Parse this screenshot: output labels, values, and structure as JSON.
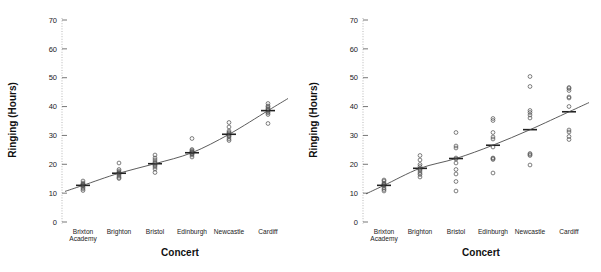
{
  "figure": {
    "title": "",
    "panel_count": 2
  },
  "chart_data": [
    {
      "type": "scatter",
      "title": "",
      "panel": "left",
      "xlabel": "Concert",
      "ylabel": "Ringing (Hours)",
      "categories": [
        "Brixton Academy",
        "Brighton",
        "Bristol",
        "Edinburgh",
        "Newcastle",
        "Cardiff"
      ],
      "yticks": [
        0,
        10,
        20,
        30,
        40,
        50,
        60,
        70
      ],
      "ylim": [
        0,
        73
      ],
      "grid": false,
      "legend": null,
      "annotations": [
        "fitted trend line through group means"
      ],
      "series": [
        {
          "name": "Brixton Academy",
          "values": [
            11.0,
            11.5,
            12.0,
            12.4,
            12.6,
            12.8,
            13.0,
            13.2,
            13.6,
            14.2
          ]
        },
        {
          "name": "Brighton",
          "values": [
            15.0,
            15.4,
            16.0,
            16.4,
            16.8,
            17.0,
            17.2,
            17.6,
            18.2,
            20.4
          ]
        },
        {
          "name": "Bristol",
          "values": [
            17.2,
            18.4,
            19.0,
            19.6,
            20.0,
            20.4,
            20.8,
            21.4,
            22.2,
            23.2
          ]
        },
        {
          "name": "Edinburgh",
          "values": [
            22.6,
            23.2,
            23.6,
            23.8,
            24.0,
            24.2,
            24.4,
            24.8,
            25.2,
            29.0
          ]
        },
        {
          "name": "Newcastle",
          "values": [
            28.2,
            28.8,
            29.4,
            29.8,
            30.2,
            30.6,
            31.0,
            31.6,
            33.0,
            34.4
          ]
        },
        {
          "name": "Cardiff",
          "values": [
            34.2,
            37.2,
            37.8,
            38.2,
            38.6,
            39.0,
            39.4,
            39.8,
            40.2,
            41.0
          ]
        }
      ],
      "group_means": [
        12.7,
        16.9,
        20.2,
        24.0,
        30.4,
        38.6
      ]
    },
    {
      "type": "scatter",
      "title": "",
      "panel": "right",
      "xlabel": "Concert",
      "ylabel": "Ringing (Hours)",
      "categories": [
        "Brixton Academy",
        "Brighton",
        "Bristol",
        "Edinburgh",
        "Newcastle",
        "Cardiff"
      ],
      "yticks": [
        0,
        10,
        20,
        30,
        40,
        50,
        60,
        70
      ],
      "ylim": [
        0,
        73
      ],
      "grid": false,
      "legend": null,
      "annotations": [
        "fitted trend line through group means",
        "greater within-group spread than left panel"
      ],
      "series": [
        {
          "name": "Brixton Academy",
          "values": [
            10.8,
            11.2,
            11.8,
            12.4,
            12.8,
            13.0,
            13.2,
            13.6,
            14.2,
            14.6
          ]
        },
        {
          "name": "Brighton",
          "values": [
            15.6,
            16.4,
            17.0,
            17.6,
            18.2,
            18.6,
            19.2,
            20.0,
            21.4,
            23.0
          ]
        },
        {
          "name": "Bristol",
          "values": [
            10.8,
            14.0,
            16.6,
            18.2,
            20.4,
            21.8,
            22.2,
            25.6,
            26.4,
            31.0
          ]
        },
        {
          "name": "Edinburgh",
          "values": [
            17.0,
            21.6,
            22.0,
            22.2,
            26.0,
            28.8,
            29.4,
            31.0,
            35.2,
            35.8
          ]
        },
        {
          "name": "Newcastle",
          "values": [
            19.8,
            23.0,
            23.4,
            23.8,
            36.0,
            37.0,
            38.0,
            38.6,
            47.0,
            50.4
          ]
        },
        {
          "name": "Cardiff",
          "values": [
            28.6,
            29.6,
            31.2,
            31.8,
            40.0,
            43.0,
            43.4,
            45.6,
            46.2,
            46.6
          ]
        }
      ],
      "group_means": [
        12.7,
        18.6,
        22.0,
        26.6,
        32.0,
        38.2
      ]
    }
  ],
  "axes": {
    "y_tick_labels": [
      "0",
      "10",
      "20",
      "30",
      "40",
      "50",
      "60",
      "70"
    ],
    "x_tick_labels_line1": [
      "Brixton",
      "Brighton",
      "Bristol",
      "Edinburgh",
      "Newcastle",
      "Cardiff"
    ],
    "x_tick_labels_line2": [
      "Academy",
      "",
      "",
      "",
      "",
      ""
    ],
    "y_axis_title": "Ringing (Hours)",
    "x_axis_title": "Concert"
  },
  "colors": {
    "point_stroke": "#555555",
    "line": "#4a4a4a",
    "axis": "#9a9a9a",
    "text": "#111111",
    "background": "#ffffff"
  }
}
